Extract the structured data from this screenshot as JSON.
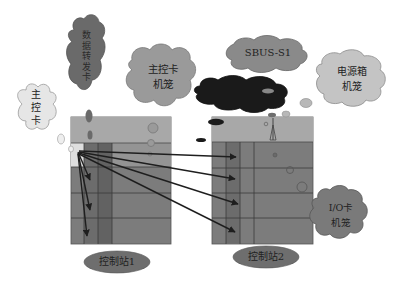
{
  "diagram": {
    "type": "control-station-card-layout",
    "clouds": [
      {
        "id": "main-control-card",
        "label": "主\n控\n卡",
        "fill": "#e6e6e6"
      },
      {
        "id": "data-forward-card",
        "label": "数\n据\n转\n发\n卡",
        "fill": "#6a6a6a"
      },
      {
        "id": "main-control-cage",
        "label": "主控卡\n机笼",
        "fill": "#9a9a9a"
      },
      {
        "id": "sbus-s1",
        "label": "SBUS-S1",
        "fill": "#8a8a8a"
      },
      {
        "id": "sbus-dark",
        "label": "",
        "fill": "#1a1a1a"
      },
      {
        "id": "power-cage",
        "label": "电源箱\n机笼",
        "fill": "#c4c4c4"
      },
      {
        "id": "io-card-cage",
        "label": "I/O卡\n机笼",
        "fill": "#7a7a7a"
      }
    ],
    "stations": [
      {
        "id": "station-1",
        "label": "控制站1"
      },
      {
        "id": "station-2",
        "label": "控制站2"
      }
    ],
    "connections": {
      "from": "main-control-card",
      "to_station1_rows": 3,
      "to_station2_rows": 4
    },
    "colors": {
      "panel_top": "#a8a8a8",
      "panel_body": "#7c7c7c",
      "panel_dark_col": "#6a6a6a",
      "grid_line": "#3a3a3a",
      "arrow": "#1e1e1e",
      "station_ellipse": "#6e6e6e"
    }
  }
}
